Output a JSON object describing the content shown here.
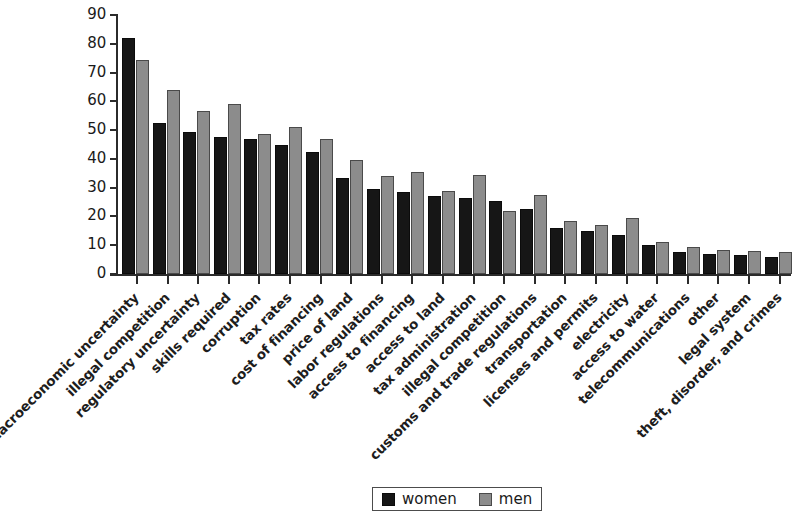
{
  "chart_data": {
    "type": "bar",
    "title": "",
    "subtitle": "",
    "xlabel": "",
    "ylabel": "",
    "ylim": [
      0,
      90
    ],
    "ytick_values": [
      0,
      10,
      20,
      30,
      40,
      50,
      60,
      70,
      80,
      90
    ],
    "ytick_labels": [
      "0",
      "10",
      "20",
      "30",
      "40",
      "50",
      "60",
      "70",
      "80",
      "90"
    ],
    "grid": false,
    "legend_position": "bottom-center",
    "categories": [
      "macroeconomic uncertainty",
      "illegal competition",
      "regulatory uncertainty",
      "skills required",
      "corruption",
      "tax rates",
      "cost of financing",
      "price of land",
      "labor regulations",
      "access to financing",
      "access to land",
      "tax administration",
      "illegal competition",
      "customs and trade regulations",
      "transportation",
      "licenses and permits",
      "electricity",
      "access to water",
      "telecommunications",
      "other",
      "legal system",
      "theft, disorder, and crimes"
    ],
    "series": [
      {
        "name": "women",
        "color": "#161616",
        "values": [
          82,
          52.5,
          49.5,
          47.5,
          47,
          45,
          42.5,
          33.5,
          29.5,
          28.5,
          27,
          26.5,
          25.5,
          22.5,
          16,
          15,
          13.5,
          10,
          7.5,
          7,
          6.5,
          6
        ]
      },
      {
        "name": "men",
        "color": "#8c8c8c",
        "values": [
          74.5,
          64,
          56.5,
          59,
          48.5,
          51,
          47,
          39.5,
          34,
          35.5,
          29,
          34.5,
          22,
          27.5,
          18.5,
          17,
          19.5,
          11,
          9.5,
          8.5,
          8,
          7.5
        ]
      }
    ]
  },
  "legend": {
    "items": [
      {
        "label": "women",
        "swatch": "black-square-swatch"
      },
      {
        "label": "men",
        "swatch": "gray-square-swatch"
      }
    ]
  }
}
